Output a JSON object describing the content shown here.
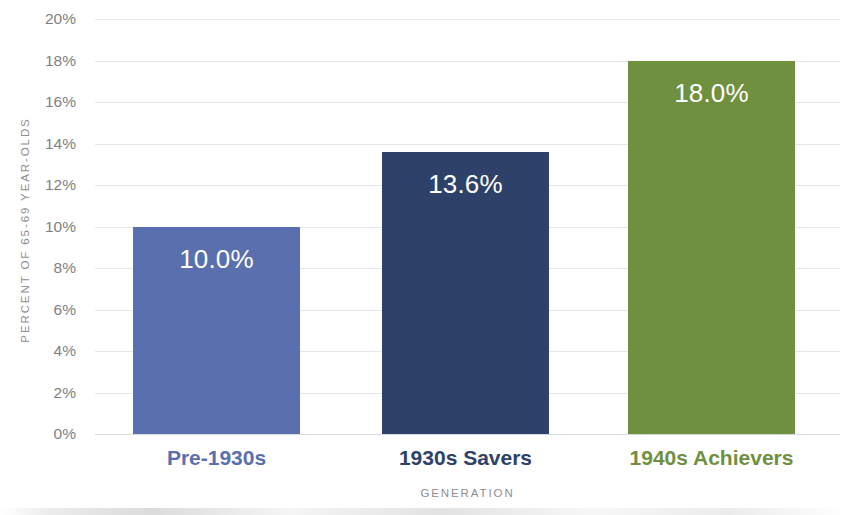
{
  "chart_data": {
    "type": "bar",
    "title": "",
    "xlabel": "GENERATION",
    "ylabel": "PERCENT OF 65-69 YEAR-OLDS",
    "categories": [
      "Pre-1930s",
      "1930s Savers",
      "1940s Achievers"
    ],
    "values": [
      10.0,
      13.6,
      18.0
    ],
    "value_labels": [
      "10.0%",
      "13.6%",
      "18.0%"
    ],
    "bar_colors": [
      "#5a6fae",
      "#2e4269",
      "#6f903f"
    ],
    "category_label_colors": [
      "#5a6fae",
      "#2e4269",
      "#6f903f"
    ],
    "ylim": [
      0,
      20
    ],
    "ytick_values": [
      20,
      18,
      16,
      14,
      12,
      10,
      8,
      6,
      4,
      2,
      0
    ],
    "ytick_labels": [
      "20%",
      "18%",
      "16%",
      "14%",
      "12%",
      "10%",
      "8%",
      "6%",
      "4%",
      "2%",
      "0%"
    ],
    "grid": true,
    "grid_color": "#e4e7e9",
    "legend": "none",
    "background": "#ffffff",
    "axis_text_color": "#8e8e8e",
    "tick_text_color": "#7f7f7f",
    "value_label_color": "#ffffff"
  }
}
